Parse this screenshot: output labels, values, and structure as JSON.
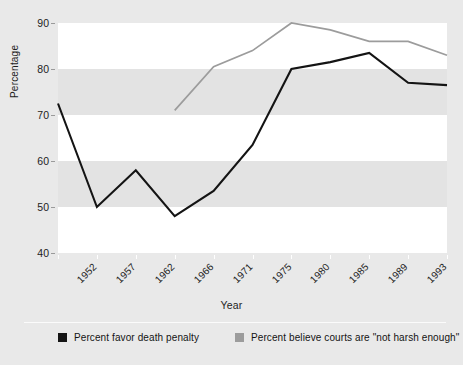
{
  "figure": {
    "background_color": "#e9e9e9",
    "plot_band_white": "#ffffff",
    "plot_band_gray": "#e3e3e3"
  },
  "axes": {
    "y_title": "Percentage",
    "x_title": "Year",
    "y_ticks": [
      "90",
      "80",
      "70",
      "60",
      "50",
      "40"
    ],
    "x_ticks": [
      "1952",
      "1957",
      "1962",
      "1966",
      "1971",
      "1975",
      "1980",
      "1985",
      "1989",
      "1993",
      "1996"
    ]
  },
  "legend": {
    "items": [
      {
        "label": "Percent favor death penalty",
        "color": "#141414"
      },
      {
        "label": "Percent believe courts are \"not harsh enough\"",
        "color": "#9c9c9c"
      }
    ]
  },
  "chart_data": {
    "type": "line",
    "title": "",
    "xlabel": "Year",
    "ylabel": "Percentage",
    "x": [
      1952,
      1957,
      1962,
      1966,
      1971,
      1975,
      1980,
      1985,
      1989,
      1993,
      1996
    ],
    "categories": [
      "1952",
      "1957",
      "1962",
      "1966",
      "1971",
      "1975",
      "1980",
      "1985",
      "1989",
      "1993",
      "1996"
    ],
    "ylim": [
      40,
      90
    ],
    "xlim": [
      1952,
      1996
    ],
    "grid": false,
    "legend_position": "bottom",
    "series": [
      {
        "name": "Percent favor death penalty",
        "color": "#141414",
        "values": [
          72.5,
          50,
          58,
          48,
          53.5,
          63.5,
          80,
          81.5,
          83.5,
          77,
          76.5
        ]
      },
      {
        "name": "Percent believe courts are \"not harsh enough\"",
        "color": "#9c9c9c",
        "values": [
          null,
          null,
          null,
          71,
          80.5,
          84,
          90,
          88.5,
          86,
          86,
          83
        ]
      }
    ]
  }
}
